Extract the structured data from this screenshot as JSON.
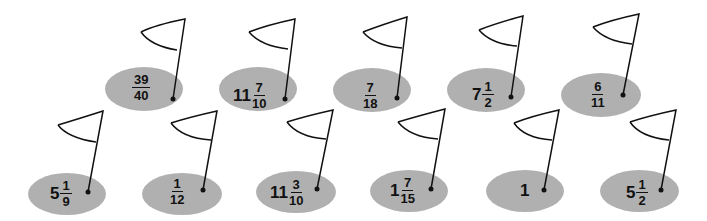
{
  "colors": {
    "green": "#b0b0b0",
    "ink": "#111111",
    "background": "#ffffff"
  },
  "rows": [
    {
      "name": "top-row",
      "holes": [
        {
          "whole": "",
          "numerator": "39",
          "denominator": "40"
        },
        {
          "whole": "11",
          "numerator": "7",
          "denominator": "10"
        },
        {
          "whole": "",
          "numerator": "7",
          "denominator": "18"
        },
        {
          "whole": "7",
          "numerator": "1",
          "denominator": "2"
        },
        {
          "whole": "",
          "numerator": "6",
          "denominator": "11"
        }
      ]
    },
    {
      "name": "bottom-row",
      "holes": [
        {
          "whole": "5",
          "numerator": "1",
          "denominator": "9"
        },
        {
          "whole": "",
          "numerator": "1",
          "denominator": "12"
        },
        {
          "whole": "11",
          "numerator": "3",
          "denominator": "10"
        },
        {
          "whole": "1",
          "numerator": "7",
          "denominator": "15"
        },
        {
          "whole": "1",
          "numerator": "",
          "denominator": ""
        },
        {
          "whole": "5",
          "numerator": "1",
          "denominator": "2"
        }
      ]
    }
  ]
}
